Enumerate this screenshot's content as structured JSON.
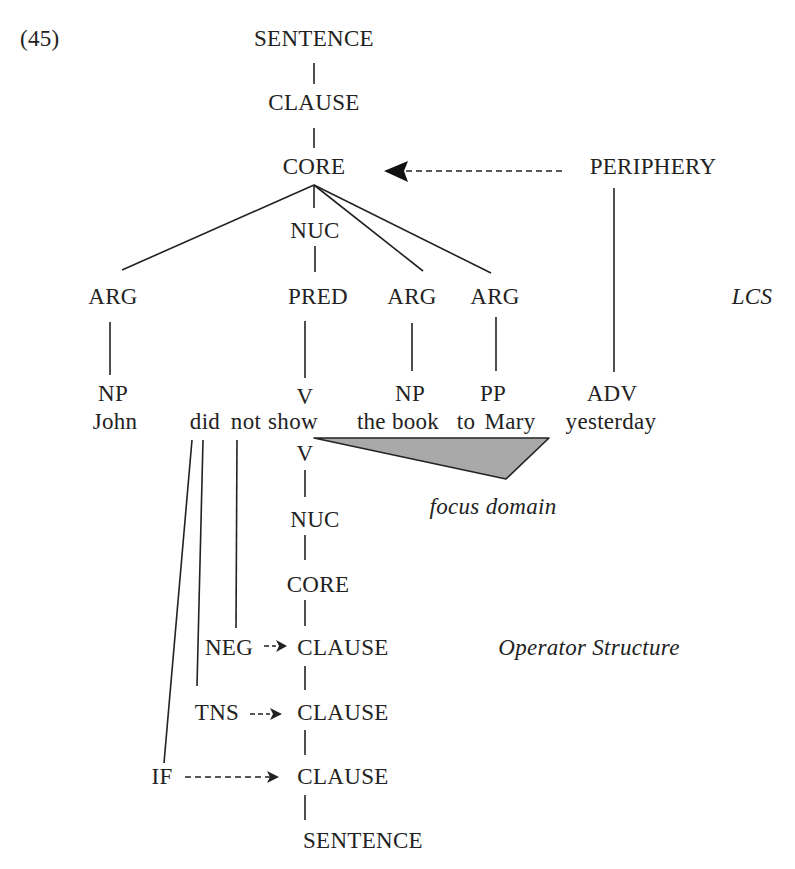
{
  "example_number": "(45)",
  "layered_structure": {
    "sentence": "SENTENCE",
    "clause": "CLAUSE",
    "core": "CORE",
    "periphery": "PERIPHERY",
    "nuc": "NUC",
    "args": [
      "ARG",
      "ARG",
      "ARG"
    ],
    "pred": "PRED",
    "phrases": {
      "np1": "NP",
      "v": "V",
      "np2": "NP",
      "pp": "PP",
      "adv": "ADV"
    },
    "annotation": "LCS"
  },
  "sentence_words": {
    "john": "John",
    "did": "did",
    "not": "not",
    "show": "show",
    "the_book": "the book",
    "to": "to",
    "mary": "Mary",
    "yesterday": "yesterday"
  },
  "focus": {
    "label": "focus domain",
    "fill_color": "#a9a9a9"
  },
  "operator_structure": {
    "label": "Operator Structure",
    "v": "V",
    "nuc": "NUC",
    "core": "CORE",
    "neg": "NEG",
    "neg_target": "CLAUSE",
    "tns": "TNS",
    "tns_target": "CLAUSE",
    "if": "IF",
    "if_target": "CLAUSE",
    "sentence": "SENTENCE"
  }
}
